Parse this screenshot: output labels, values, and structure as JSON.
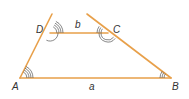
{
  "diagram": {
    "type": "trapezoid-angles",
    "colors": {
      "edge": "#e8a04a",
      "arc": "#555555",
      "label": "#333333"
    },
    "vertices": {
      "A": {
        "label": "A",
        "x": 20,
        "y": 78
      },
      "B": {
        "label": "B",
        "x": 171,
        "y": 78
      },
      "C": {
        "label": "C",
        "x": 108,
        "y": 33
      },
      "D": {
        "label": "D",
        "x": 50,
        "y": 33
      }
    },
    "sides": {
      "a": {
        "label": "a"
      },
      "b": {
        "label": "b"
      }
    },
    "angle_marks": {
      "A": 4,
      "D_upper": 4,
      "D_lower": 1,
      "C_left": 3,
      "C_lower": 2,
      "B": 3
    }
  }
}
